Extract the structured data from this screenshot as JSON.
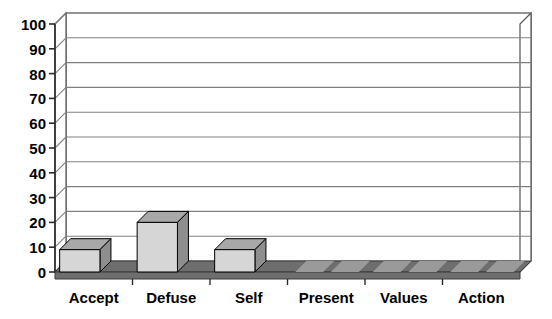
{
  "chart_data": {
    "type": "bar",
    "title": "",
    "subtitle": "",
    "xlabel": "",
    "ylabel": "",
    "categories": [
      "Accept",
      "Defuse",
      "Self",
      "Present",
      "Values",
      "Action"
    ],
    "values": [
      9,
      20,
      9,
      0,
      0,
      0
    ],
    "series": [
      {
        "name": "",
        "values": [
          9,
          20,
          9,
          0,
          0,
          0
        ]
      }
    ],
    "ylim": [
      0,
      100
    ],
    "ytick_values": [
      0,
      10,
      20,
      30,
      40,
      50,
      60,
      70,
      80,
      90,
      100
    ],
    "ytick_labels": [
      "0",
      "10",
      "20",
      "30",
      "40",
      "50",
      "60",
      "70",
      "80",
      "90",
      "100"
    ],
    "grid": true,
    "grid_axis": "y",
    "legend": false,
    "legend_position": "none",
    "three_d": true,
    "annotations": []
  },
  "style": {
    "bar_front_color": "#d6d6d6",
    "bar_side_color": "#8e8e8e",
    "bar_top_color": "#a8a8a8",
    "bar_edge_color": "#000000",
    "floor_color": "#6e6e6e",
    "floor_light_color": "#9a9a9a",
    "wall_color": "#ffffff",
    "wall_edge_color": "#555555",
    "gridline_color": "#808080",
    "axis_color": "#2b2b2b",
    "text_color": "#000000",
    "background_color": "#ffffff"
  }
}
